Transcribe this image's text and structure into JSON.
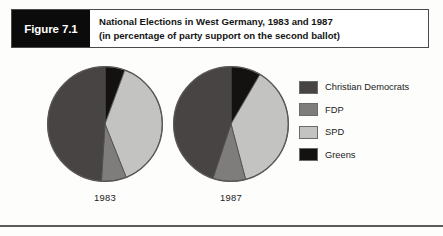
{
  "figure": {
    "tag": "Figure 7.1",
    "title_line_1": "National Elections in West Germany, 1983 and 1987",
    "title_line_2": "(in percentage of party support on the second ballot)"
  },
  "legend": {
    "items": [
      {
        "label": "Christian Democrats",
        "color": "#474443"
      },
      {
        "label": "FDP",
        "color": "#7e7d7b"
      },
      {
        "label": "SPD",
        "color": "#c3c3c1"
      },
      {
        "label": "Greens",
        "color": "#141211"
      }
    ]
  },
  "chart_data": {
    "type": "pie",
    "title": "National Elections in West Germany, 1983 and 1987",
    "subtitle": "(in percentage of party support on the second ballot)",
    "unit": "percent",
    "legend_position": "right",
    "categories": [
      "Christian Democrats",
      "FDP",
      "SPD",
      "Greens"
    ],
    "colors": [
      "#474443",
      "#7e7d7b",
      "#c3c3c1",
      "#141211"
    ],
    "charts": [
      {
        "label": "1983",
        "values": [
          48.8,
          7.0,
          38.2,
          5.6
        ]
      },
      {
        "label": "1987",
        "values": [
          44.3,
          9.1,
          37.0,
          8.3
        ]
      }
    ]
  }
}
